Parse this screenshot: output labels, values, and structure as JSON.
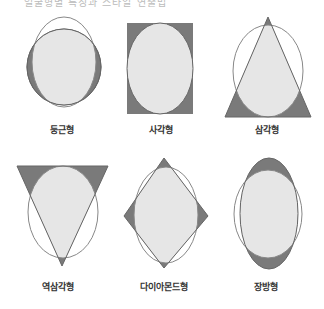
{
  "header": {
    "text": "얼굴형별 특징과 스타일 연출법"
  },
  "colors": {
    "dark_fill": "#7a7a7a",
    "light_fill": "#e6e6e6",
    "outline": "#666666",
    "ref_outline": "#888888",
    "background": "#ffffff"
  },
  "shapes": [
    {
      "id": "round",
      "label": "둥근형"
    },
    {
      "id": "square",
      "label": "사각형"
    },
    {
      "id": "triangle",
      "label": "삼각형"
    },
    {
      "id": "inverted-triangle",
      "label": "역삼각형"
    },
    {
      "id": "diamond",
      "label": "다이아몬드형"
    },
    {
      "id": "oblong",
      "label": "장방형"
    }
  ]
}
